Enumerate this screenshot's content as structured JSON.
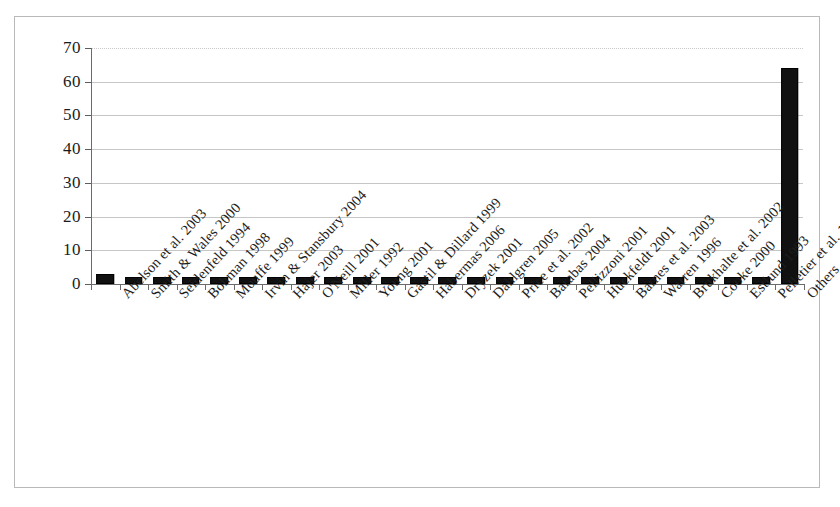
{
  "chart_data": {
    "type": "bar",
    "title": "",
    "subtitle": "",
    "xlabel": "",
    "ylabel": "",
    "ylim": [
      0,
      70
    ],
    "ytick_step": 10,
    "yticks": [
      "0",
      "10",
      "20",
      "30",
      "40",
      "50",
      "60",
      "70"
    ],
    "grid": "horizontal",
    "legend": "none",
    "orientation": "vertical",
    "bar_color": "#111111",
    "categories": [
      "Abelson et al. 2003",
      "Smith & Wales 2000",
      "Seidenfeld 1994",
      "Bohman 1998",
      "Mouffe 1999",
      "Irvin & Stansbury 2004",
      "Hajer 2003",
      "O'Neill 2001",
      "Miller 1992",
      "Young 2001",
      "Gastil & Dillard 1999",
      "Habermas 2006",
      "Dryzek 2001",
      "Dahlgren 2005",
      "Price et al. 2002",
      "Barabas 2004",
      "Pellizzoni 2001",
      "Huckfeldt 2001",
      "Barnes et al. 2003",
      "Warren 1996",
      "Brukhalte et al. 2002",
      "Cooke 2000",
      "Estlund 1993",
      "Pelletier et al. 1999",
      "Others"
    ],
    "values": [
      3,
      2,
      2,
      2,
      2,
      2,
      2,
      2,
      2,
      2,
      2,
      2,
      2,
      2,
      2,
      2,
      2,
      2,
      2,
      2,
      2,
      2,
      2,
      2,
      64
    ]
  },
  "axis": {
    "y_ticks": [
      {
        "label": "70",
        "value": 70
      },
      {
        "label": "60",
        "value": 60
      },
      {
        "label": "50",
        "value": 50
      },
      {
        "label": "40",
        "value": 40
      },
      {
        "label": "30",
        "value": 30
      },
      {
        "label": "20",
        "value": 20
      },
      {
        "label": "10",
        "value": 10
      },
      {
        "label": "0",
        "value": 0
      }
    ]
  },
  "colors": {
    "bar": "#111111",
    "grid": "#c6c6c6",
    "axis": "#6b6b6b",
    "frame": "#b9b9b9",
    "text": "#1b1b1b",
    "background": "#ffffff"
  }
}
